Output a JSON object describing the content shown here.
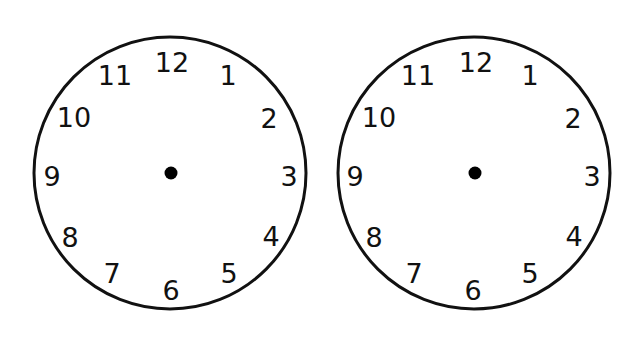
{
  "colors": {
    "background": "#ffffff",
    "stroke": "#111111",
    "numerals": "#111111",
    "center_dot": "#000000"
  },
  "clocks": [
    {
      "id": "left",
      "center": [
        170,
        173
      ],
      "radius": 136,
      "numerals": [
        {
          "label": "12",
          "x": 172,
          "y": 62
        },
        {
          "label": "1",
          "x": 228,
          "y": 75
        },
        {
          "label": "2",
          "x": 269,
          "y": 118
        },
        {
          "label": "3",
          "x": 289,
          "y": 176
        },
        {
          "label": "4",
          "x": 271,
          "y": 236
        },
        {
          "label": "5",
          "x": 229,
          "y": 273
        },
        {
          "label": "6",
          "x": 171,
          "y": 290
        },
        {
          "label": "7",
          "x": 112,
          "y": 273
        },
        {
          "label": "8",
          "x": 70,
          "y": 237
        },
        {
          "label": "9",
          "x": 52,
          "y": 176
        },
        {
          "label": "10",
          "x": 74,
          "y": 117
        },
        {
          "label": "11",
          "x": 115,
          "y": 75
        }
      ]
    },
    {
      "id": "right",
      "center": [
        474,
        173
      ],
      "radius": 136,
      "numerals": [
        {
          "label": "12",
          "x": 476,
          "y": 62
        },
        {
          "label": "1",
          "x": 530,
          "y": 75
        },
        {
          "label": "2",
          "x": 573,
          "y": 118
        },
        {
          "label": "3",
          "x": 592,
          "y": 176
        },
        {
          "label": "4",
          "x": 574,
          "y": 236
        },
        {
          "label": "5",
          "x": 530,
          "y": 273
        },
        {
          "label": "6",
          "x": 473,
          "y": 290
        },
        {
          "label": "7",
          "x": 414,
          "y": 273
        },
        {
          "label": "8",
          "x": 374,
          "y": 237
        },
        {
          "label": "9",
          "x": 355,
          "y": 176
        },
        {
          "label": "10",
          "x": 379,
          "y": 117
        },
        {
          "label": "11",
          "x": 418,
          "y": 75
        }
      ]
    }
  ]
}
